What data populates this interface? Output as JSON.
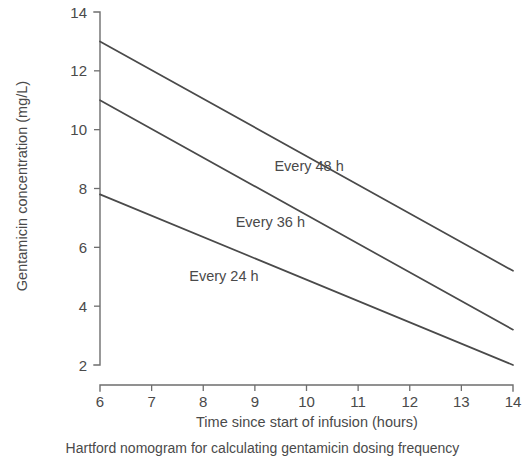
{
  "chart_data": {
    "type": "line",
    "title": "",
    "caption": "Hartford nomogram for calculating gentamicin dosing frequency",
    "xlabel": "Time since start of infusion (hours)",
    "ylabel": "Gentamicin concentration (mg/L)",
    "xlim": [
      6,
      14
    ],
    "ylim": [
      2,
      14
    ],
    "xticks": [
      6,
      7,
      8,
      9,
      10,
      11,
      12,
      13,
      14
    ],
    "xticklabels": [
      "6",
      "7",
      "8",
      "9",
      "10",
      "11",
      "12",
      "13",
      "14"
    ],
    "yticks": [
      2,
      4,
      6,
      8,
      10,
      12,
      14
    ],
    "yticklabels": [
      "2",
      "4",
      "6",
      "8",
      "10",
      "12",
      "14"
    ],
    "grid": false,
    "legend_position": "inline-annotations",
    "line_color": "#4a4a4a",
    "axis_color": "#6e6e6e",
    "series": [
      {
        "name": "Every 48 h",
        "label": "Every 48 h",
        "x": [
          6,
          14
        ],
        "values": [
          13.0,
          5.2
        ],
        "label_x": 10.05,
        "label_y": 8.6
      },
      {
        "name": "Every 36 h",
        "label": "Every 36 h",
        "x": [
          6,
          14
        ],
        "values": [
          11.0,
          3.2
        ],
        "label_x": 9.3,
        "label_y": 6.7
      },
      {
        "name": "Every 24 h",
        "label": "Every 24 h",
        "x": [
          6,
          14
        ],
        "values": [
          7.8,
          2.0
        ],
        "label_x": 8.4,
        "label_y": 4.85
      }
    ]
  }
}
